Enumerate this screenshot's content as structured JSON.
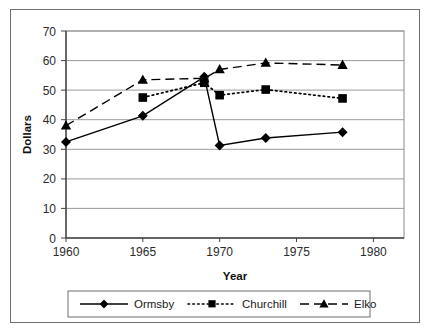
{
  "chart_data": {
    "type": "line",
    "title": "",
    "xlabel": "Year",
    "ylabel": "Dollars",
    "xlim": [
      1960,
      1982
    ],
    "ylim": [
      0,
      70
    ],
    "xticks": [
      1960,
      1965,
      1970,
      1975,
      1980
    ],
    "yticks": [
      0,
      10,
      20,
      30,
      40,
      50,
      60,
      70
    ],
    "grid": "horizontal",
    "legend_position": "below-plot",
    "series": [
      {
        "name": "Ormsby",
        "marker": "diamond",
        "line_style": "solid",
        "color": "#000000",
        "x": [
          1960,
          1965,
          1969,
          1970,
          1973,
          1978
        ],
        "values": [
          32.5,
          41.3,
          54.5,
          31.3,
          33.8,
          35.8
        ]
      },
      {
        "name": "Churchill",
        "marker": "square",
        "line_style": "dotted",
        "color": "#000000",
        "x": [
          1965,
          1969,
          1970,
          1973,
          1978
        ],
        "values": [
          47.5,
          52.5,
          48.3,
          50.2,
          47.2
        ]
      },
      {
        "name": "Elko",
        "marker": "triangle",
        "line_style": "dashed",
        "color": "#000000",
        "x": [
          1960,
          1965,
          1969,
          1970,
          1973,
          1978
        ],
        "values": [
          38.0,
          53.5,
          54.0,
          57.0,
          59.2,
          58.5
        ]
      }
    ]
  },
  "axes": {
    "y_title": "Dollars",
    "x_title": "Year",
    "y_tick_labels": [
      "70",
      "60",
      "50",
      "40",
      "30",
      "20",
      "10",
      "0"
    ],
    "x_tick_labels": [
      "1960",
      "1965",
      "1970",
      "1975",
      "1980"
    ]
  },
  "legend": {
    "items": [
      {
        "label": "Ormsby",
        "marker": "diamond",
        "line_style": "solid"
      },
      {
        "label": "Churchill",
        "marker": "square",
        "line_style": "dotted"
      },
      {
        "label": "Elko",
        "marker": "triangle",
        "line_style": "dashed"
      }
    ]
  },
  "colors": {
    "ink": "#000000",
    "gridline": "#9a9a9a",
    "axis": "#555555",
    "frame": "#6f6f6f",
    "background": "#ffffff"
  }
}
